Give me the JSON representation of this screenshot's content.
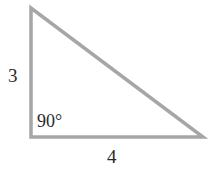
{
  "diagram": {
    "type": "right-triangle",
    "stroke_color": "#a6a6a6",
    "background": "#ffffff",
    "vertices": {
      "top": [
        31,
        8
      ],
      "bottom_left": [
        31,
        137
      ],
      "bottom_right": [
        203,
        137
      ]
    },
    "labels": {
      "vertical_side": "3",
      "horizontal_side": "4",
      "right_angle": "90°"
    }
  }
}
